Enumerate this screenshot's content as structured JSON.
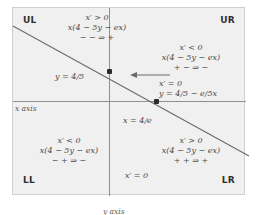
{
  "diagram": {
    "type": "phase-plane-nullcline",
    "corners": {
      "upper_left": "UL",
      "upper_right": "UR",
      "lower_left": "LL",
      "lower_right": "LR"
    },
    "axes": {
      "x_axis_label": "x axis",
      "y_axis_label": "y axis"
    },
    "regions": {
      "upper_left": {
        "sign": "x′ > 0",
        "expression": "x(4 − 5y − ex)",
        "signs": "−  − ⇒ +"
      },
      "upper_right": {
        "sign": "x′ < 0",
        "expression": "x(4 − 5y − ex)",
        "signs": "+  − ⇒ −"
      },
      "lower_left": {
        "sign": "x′ < 0",
        "expression": "x(4 − 5y − ex)",
        "signs": "−  + ⇒ −"
      },
      "lower_right": {
        "sign": "x′ > 0",
        "expression": "x(4 − 5y − ex)",
        "signs": "+  + ⇒ +"
      }
    },
    "annotations": {
      "y_intercept": "y = 4/5",
      "x_intercept": "x = 4/e",
      "nullcline_sign": "x′ = 0",
      "nullcline_equation": "y = 4/5 − e/5x",
      "y_axis_nullcline": "x′ = 0"
    },
    "colors": {
      "plot_background": "#f0f0f0",
      "axis": "#8f8f8f",
      "nullcline": "#6b6b6b",
      "text": "#4a4a4a",
      "dot": "#2b2b2b"
    }
  }
}
